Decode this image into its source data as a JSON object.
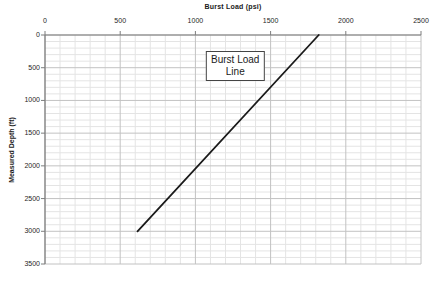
{
  "chart_data": {
    "type": "line",
    "title": "",
    "top_axis_label": "Burst Load (psi)",
    "ylabel": "Measured Depth (ft)",
    "xlabel": "Burst Load (psi)",
    "xlim": [
      0,
      2500
    ],
    "ylim": [
      0,
      3500
    ],
    "y_axis_inverted": true,
    "x_axis_position": "top",
    "x_ticks": [
      0,
      500,
      1000,
      1500,
      2000,
      2500
    ],
    "y_ticks": [
      0,
      500,
      1000,
      1500,
      2000,
      2500,
      3000,
      3500
    ],
    "minor_grid_step_x": 100,
    "minor_grid_step_y": 100,
    "grid": true,
    "legend": "none",
    "series": [
      {
        "name": "Burst Load Line",
        "color": "#1a1a1a",
        "points_load_depth": [
          [
            1820,
            0
          ],
          [
            615,
            3000
          ]
        ]
      }
    ],
    "annotation": {
      "lines": [
        "Burst Load",
        "Line"
      ],
      "anchor_load_psi": 1265,
      "anchor_depth_ft": 480
    },
    "colors": {
      "background": "#ffffff",
      "minor_grid": "#e4e4e4",
      "major_grid": "#c2c2c2",
      "axis": "#7d7d7d",
      "tick_text": "#262626",
      "line": "#1a1a1a"
    }
  }
}
